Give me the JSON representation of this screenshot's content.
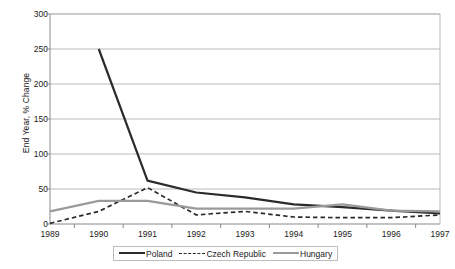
{
  "chart_data": {
    "type": "line",
    "title": "",
    "xlabel": "",
    "ylabel": "End Year, % Change",
    "categories": [
      "1989",
      "1990",
      "1991",
      "1992",
      "1993",
      "1994",
      "1995",
      "1996",
      "1997"
    ],
    "ylim": [
      0,
      300
    ],
    "yticks": [
      "0",
      "50",
      "100",
      "150",
      "200",
      "250",
      "300"
    ],
    "grid": true,
    "legend_position": "bottom",
    "series": [
      {
        "name": "Poland",
        "color": "#2b2b2b",
        "style": "solid",
        "values": [
          null,
          250,
          62,
          45,
          38,
          28,
          24,
          19,
          15
        ]
      },
      {
        "name": "Czech Republic",
        "color": "#2b2b2b",
        "style": "dashed",
        "values": [
          1,
          18,
          52,
          13,
          18,
          10,
          9,
          9,
          13
        ]
      },
      {
        "name": "Hungary",
        "color": "#9a9a9a",
        "style": "solid",
        "values": [
          18,
          33,
          33,
          22,
          22,
          22,
          28,
          19,
          18
        ]
      }
    ]
  },
  "legend": {
    "items": [
      {
        "label": "Poland"
      },
      {
        "label": "Czech Republic"
      },
      {
        "label": "Hungary"
      }
    ]
  }
}
